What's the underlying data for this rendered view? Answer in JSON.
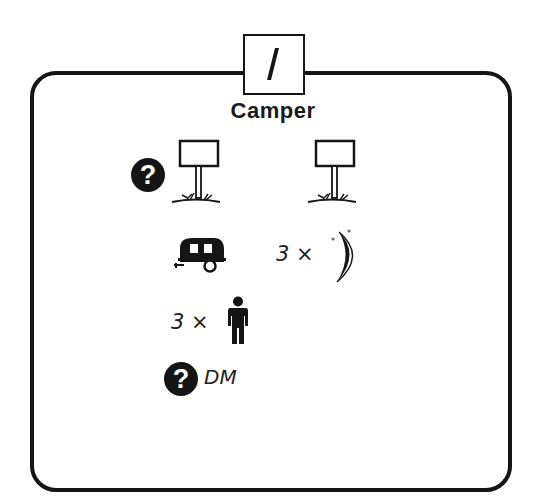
{
  "card": {
    "number": "1",
    "title": "Camper"
  },
  "rows": {
    "signs": {
      "left_badge": "?",
      "left_icon": "signpost-icon",
      "right_icon": "signpost-icon"
    },
    "vehicle": {
      "icon": "camper-trailer-icon",
      "nights_multiplier": "3 ×",
      "nights_icon": "moon-stars-icon"
    },
    "people": {
      "multiplier": "3 ×",
      "icon": "person-icon"
    },
    "dm": {
      "badge": "?",
      "label": "DM"
    }
  },
  "colors": {
    "ink": "#151515",
    "background": "#ffffff"
  }
}
